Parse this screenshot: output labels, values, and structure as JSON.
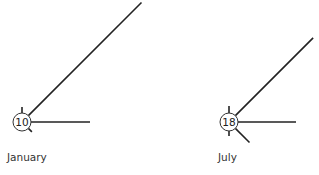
{
  "chart_data": {
    "type": "wind-rose",
    "title": "",
    "roses": [
      {
        "label": "January",
        "calm_value": "10",
        "center": [
          22,
          122
        ],
        "circle_radius": 9,
        "label_pos": [
          7,
          151
        ],
        "spokes": [
          {
            "direction": "N",
            "angle_deg": 0,
            "length": 6
          },
          {
            "direction": "NE",
            "angle_deg": 45,
            "length": 160
          },
          {
            "direction": "E",
            "angle_deg": 90,
            "length": 59
          },
          {
            "direction": "SE",
            "angle_deg": 135,
            "length": 5
          }
        ]
      },
      {
        "label": "July",
        "calm_value": "18",
        "center": [
          229,
          122
        ],
        "circle_radius": 9,
        "label_pos": [
          218,
          151
        ],
        "spokes": [
          {
            "direction": "N",
            "angle_deg": 0,
            "length": 7
          },
          {
            "direction": "NE",
            "angle_deg": 45,
            "length": 110
          },
          {
            "direction": "E",
            "angle_deg": 90,
            "length": 58
          },
          {
            "direction": "SE",
            "angle_deg": 135,
            "length": 20
          },
          {
            "direction": "S",
            "angle_deg": 180,
            "length": 5
          }
        ]
      }
    ],
    "stroke_color": "#222222",
    "background": "#ffffff"
  }
}
